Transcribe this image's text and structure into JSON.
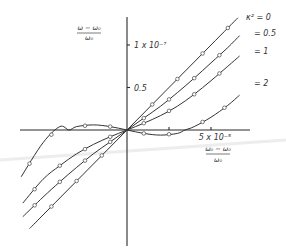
{
  "chart_data": {
    "type": "line",
    "title": "",
    "xlabel": {
      "numerator": "ω₀ − ω₀",
      "denominator": "ω₀"
    },
    "ylabel": {
      "numerator": "ω − ω₀",
      "denominator": "ω₀"
    },
    "x_unit": 1e-05,
    "y_unit": 1e-08,
    "xlim": [
      -6.5,
      7.0
    ],
    "ylim": [
      -14,
      13.5
    ],
    "x_ticks": [
      {
        "value": 2.5,
        "label": ""
      },
      {
        "value": 5,
        "label": "5 x 10⁻⁵"
      }
    ],
    "y_ticks": [
      {
        "value": 5,
        "label": "0.5"
      },
      {
        "value": 10,
        "label": "1 x 10⁻⁷"
      }
    ],
    "grid": false,
    "legend_placement": "top-right",
    "series": [
      {
        "name": "κ² = 0",
        "legend_label": "κ² = 0",
        "x": [
          -5.8,
          -5,
          -4,
          -3,
          -2,
          -1,
          0,
          1,
          2,
          3,
          4,
          5,
          6,
          6.6
        ],
        "y": [
          -11.6,
          -10,
          -8,
          -6,
          -4,
          -2,
          0,
          2,
          4,
          6,
          8,
          10,
          12,
          13.2
        ],
        "markers_x": [
          -4.5,
          -3,
          -1.5,
          1.5,
          3,
          4.5,
          6
        ]
      },
      {
        "name": "κ² = 0.5",
        "legend_label": "= 0.5",
        "x": [
          -6.2,
          -5,
          -4,
          -3,
          -2,
          -1,
          0,
          1,
          2,
          3,
          4,
          5,
          6,
          6.7
        ],
        "y": [
          -10.2,
          -7.9,
          -6.1,
          -4.4,
          -2.8,
          -1.4,
          0,
          1.4,
          2.8,
          4.4,
          6.1,
          7.9,
          9.7,
          11.1
        ],
        "markers_x": [
          -5.5,
          -4,
          -2.5,
          -1,
          1,
          2.5,
          4,
          5.5
        ]
      },
      {
        "name": "κ² = 1",
        "legend_label": "= 1",
        "x": [
          -6.2,
          -5,
          -4,
          -3,
          -2,
          -1,
          0,
          1,
          2,
          3,
          4,
          5,
          6,
          6.7
        ],
        "y": [
          -8.6,
          -5.8,
          -4.2,
          -2.8,
          -1.7,
          -0.8,
          0,
          0.8,
          1.7,
          2.8,
          4.2,
          5.8,
          7.5,
          8.7
        ],
        "markers_x": [
          -5.5,
          -4,
          -2.5,
          -1,
          1,
          2.5,
          4,
          5.5
        ]
      },
      {
        "name": "κ² = 2",
        "legend_label": "= 2",
        "x": [
          -6.3,
          -5,
          -4,
          -3.45,
          -3,
          -2,
          -1,
          0,
          1,
          2,
          3,
          3.45,
          4,
          5,
          6,
          6.7
        ],
        "y": [
          -5.5,
          -1.5,
          0.4,
          0,
          0.4,
          0.6,
          0.4,
          0,
          -0.4,
          -0.6,
          -0.4,
          0,
          0.4,
          1.5,
          2.9,
          4.1
        ],
        "markers_x": [
          -5.8,
          -4.5,
          -2.5,
          -1,
          1,
          2.5,
          4.5,
          5.8
        ]
      }
    ]
  }
}
